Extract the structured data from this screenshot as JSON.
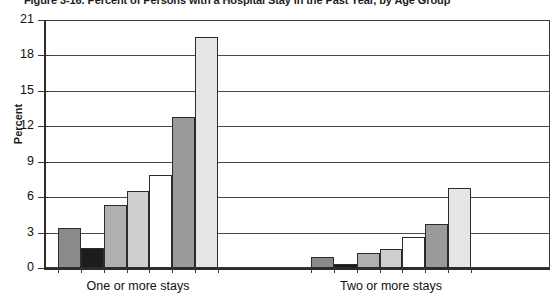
{
  "figure": {
    "title": "Figure 3-16. Percent of Persons with a Hospital Stay in the Past Year, by Age Group"
  },
  "chart_data": {
    "type": "bar",
    "title": "Figure 3-16. Percent of Persons with a Hospital Stay in the Past Year, by Age Group",
    "xlabel": "",
    "ylabel": "Percent",
    "ylim": [
      0,
      21
    ],
    "yticks": [
      0,
      3,
      6,
      9,
      12,
      15,
      18,
      21
    ],
    "ytick_labels": [
      "0",
      "3",
      "6",
      "9",
      "12",
      "15",
      "18",
      "21"
    ],
    "grid": true,
    "legend": "none",
    "categories": [
      "One or more stays",
      "Two or more stays"
    ],
    "series": [
      {
        "name": "Series 1",
        "color": "#8a8a8a",
        "values": [
          3.4,
          0.9
        ]
      },
      {
        "name": "Series 2",
        "color": "#1c1c1c",
        "values": [
          1.7,
          0.3
        ]
      },
      {
        "name": "Series 3",
        "color": "#b0b0b0",
        "values": [
          5.3,
          1.3
        ]
      },
      {
        "name": "Series 4",
        "color": "#cfcfcf",
        "values": [
          6.5,
          1.6
        ]
      },
      {
        "name": "Series 5",
        "color": "#ffffff",
        "values": [
          7.9,
          2.6
        ]
      },
      {
        "name": "Series 6",
        "color": "#9a9a9a",
        "values": [
          12.8,
          3.7
        ]
      },
      {
        "name": "Series 7",
        "color": "#e6e6e6",
        "values": [
          19.6,
          6.8
        ]
      }
    ]
  },
  "axis": {
    "y_title": "Percent"
  }
}
